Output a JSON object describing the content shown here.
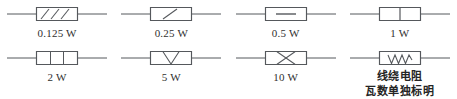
{
  "figure": {
    "stroke_color": "#55585c",
    "text_color": "#2f2f2f",
    "background_color": "#ffffff"
  },
  "symbols": [
    {
      "id": "resistor-0125w",
      "label": "0.125 W",
      "mark": "three-diagonal-slashes",
      "mark_icon_name": "triple-slash-icon"
    },
    {
      "id": "resistor-025w",
      "label": "0.25 W",
      "mark": "single-diagonal-slash",
      "mark_icon_name": "single-slash-icon"
    },
    {
      "id": "resistor-05w",
      "label": "0.5 W",
      "mark": "horizontal-bar",
      "mark_icon_name": "horizontal-bar-icon"
    },
    {
      "id": "resistor-1w",
      "label": "1 W",
      "mark": "vertical-bar",
      "mark_icon_name": "vertical-bar-icon"
    },
    {
      "id": "resistor-2w",
      "label": "2 W",
      "mark": "two-vertical-bars",
      "mark_icon_name": "double-vertical-bar-icon"
    },
    {
      "id": "resistor-5w",
      "label": "5 W",
      "mark": "vee",
      "mark_icon_name": "vee-icon"
    },
    {
      "id": "resistor-10w",
      "label": "10 W",
      "mark": "cross-x",
      "mark_icon_name": "cross-x-icon"
    },
    {
      "id": "resistor-wirewound",
      "label": "",
      "mark": "zigzag",
      "mark_icon_name": "zigzag-icon",
      "caption_line1": "线绕电阻",
      "caption_line2": "瓦数单独标明"
    }
  ]
}
